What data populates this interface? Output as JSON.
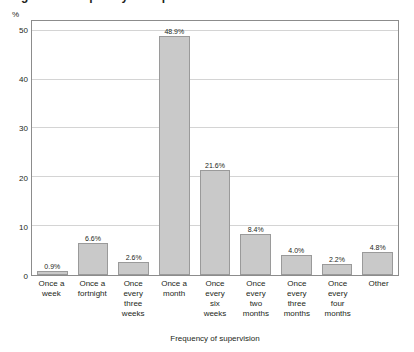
{
  "title_fragment": "Figure 6: Frequency of supervision of social workers",
  "chart_data": {
    "type": "bar",
    "title": "",
    "xlabel": "Frequency of supervision",
    "ylabel": "%",
    "ylim": [
      0,
      52
    ],
    "yticks": [
      0,
      10,
      20,
      30,
      40,
      50
    ],
    "ytick_labels": [
      "0",
      "10",
      "20",
      "30",
      "40",
      "50"
    ],
    "grid": true,
    "legend": "none",
    "bar_color": "#c9c9c9",
    "bar_edge_color": "#9a9a9a",
    "categories": [
      "Once a week",
      "Once a fortnight",
      "Once every three weeks",
      "Once a month",
      "Once every six weeks",
      "Once every two months",
      "Once every three months",
      "Once every four months",
      "Other"
    ],
    "category_lines": [
      [
        "Once a",
        "week"
      ],
      [
        "Once a",
        "fortnight"
      ],
      [
        "Once every",
        "three",
        "weeks"
      ],
      [
        "Once a",
        "month"
      ],
      [
        "Once",
        "every",
        "six",
        "weeks"
      ],
      [
        "Once",
        "every",
        "two",
        "months"
      ],
      [
        "Once",
        "every",
        "three",
        "months"
      ],
      [
        "Once",
        "every",
        "four",
        "months"
      ],
      [
        "Other"
      ]
    ],
    "values": [
      0.9,
      6.6,
      2.6,
      48.9,
      21.6,
      8.4,
      4.0,
      2.2,
      4.8
    ],
    "value_labels": [
      "0.9%",
      "6.6%",
      "2.6%",
      "48.9%",
      "21.6%",
      "8.4%",
      "4.0%",
      "2.2%",
      "4.8%"
    ]
  }
}
